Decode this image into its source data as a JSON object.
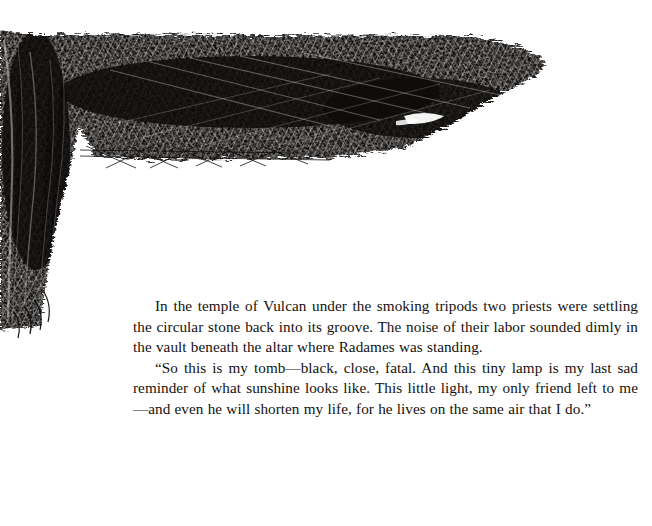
{
  "page": {
    "kind": "book-page-scan",
    "background_color": "#ffffff",
    "ink_color": "#0d0b09"
  },
  "illustration": {
    "name": "crosshatch-lintel-and-column",
    "description": "Dense pen-and-ink crosshatched drawing of a massive stone lintel beam resting on a vertical column, forming an inverted L in the upper-left of the page",
    "ink_color": "#0d0b09",
    "highlight_color": "#ffffff"
  },
  "body": {
    "paragraphs": [
      "In the temple of Vulcan under the smoking tripods two priests were settling the circular stone back into its groove. The noise of their labor sounded dimly in the vault beneath the altar where Radames was standing.",
      "“So this is my tomb—black, close, fatal. And this tiny lamp is my last sad reminder of what sunshine looks like. This little light, my only friend left to me—and even he will shorten my life, for he lives on the same air that I do.”"
    ]
  }
}
